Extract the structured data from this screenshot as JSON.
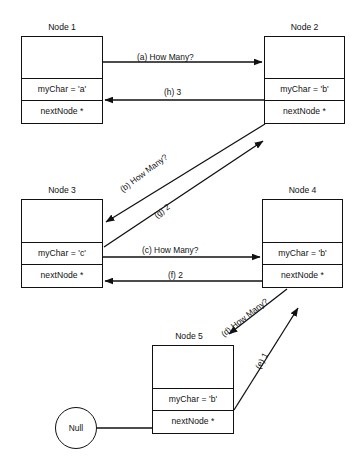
{
  "diagram": {
    "background": "#ffffff",
    "stroke": "#111111",
    "nodes": [
      {
        "id": "node1",
        "title": "Node 1",
        "mychar": "myChar = 'a'",
        "nextnode": "nextNode *",
        "x": 21,
        "y": 36,
        "w": 82,
        "h": 88
      },
      {
        "id": "node2",
        "title": "Node 2",
        "mychar": "myChar = 'b'",
        "nextnode": "nextNode *",
        "x": 264,
        "y": 36,
        "w": 81,
        "h": 88
      },
      {
        "id": "node3",
        "title": "Node 3",
        "mychar": "myChar = 'c'",
        "nextnode": "nextNode *",
        "x": 21,
        "y": 199,
        "w": 82,
        "h": 89
      },
      {
        "id": "node4",
        "title": "Node 4",
        "mychar": "myChar = 'b'",
        "nextnode": "nextNode *",
        "x": 262,
        "y": 199,
        "w": 81,
        "h": 89
      },
      {
        "id": "node5",
        "title": "Node 5",
        "mychar": "myChar = 'b'",
        "nextnode": "nextNode *",
        "x": 152,
        "y": 345,
        "w": 82,
        "h": 89
      }
    ],
    "null_terminator": {
      "label": "Null",
      "cx": 76,
      "cy": 428,
      "r": 21
    },
    "messages": [
      {
        "id": "a",
        "label": "(a) How Many?",
        "from": "node1",
        "to": "node2",
        "kind": "call",
        "x": 137,
        "y": 52,
        "rotate": 0
      },
      {
        "id": "h",
        "label": "(h) 3",
        "from": "node2",
        "to": "node1",
        "kind": "return",
        "x": 164,
        "y": 87,
        "rotate": 0
      },
      {
        "id": "b",
        "label": "(b) How Many?",
        "from": "node2",
        "to": "node3",
        "kind": "call",
        "x": 118,
        "y": 186,
        "rotate": -37
      },
      {
        "id": "g",
        "label": "(g) 2",
        "from": "node3",
        "to": "node2",
        "kind": "return",
        "x": 152,
        "y": 212,
        "rotate": -37
      },
      {
        "id": "c",
        "label": "(c) How Many?",
        "from": "node3",
        "to": "node4",
        "kind": "call",
        "x": 142,
        "y": 245,
        "rotate": 0
      },
      {
        "id": "f",
        "label": "(f) 2",
        "from": "node4",
        "to": "node3",
        "kind": "return",
        "x": 168,
        "y": 270,
        "rotate": 0
      },
      {
        "id": "d",
        "label": "(d) How Many?",
        "from": "node4",
        "to": "node5",
        "kind": "call",
        "x": 219,
        "y": 331,
        "rotate": -38
      },
      {
        "id": "e",
        "label": "(e) 1",
        "from": "node5",
        "to": "node4",
        "kind": "return",
        "x": 253,
        "y": 366,
        "rotate": -62
      }
    ]
  }
}
